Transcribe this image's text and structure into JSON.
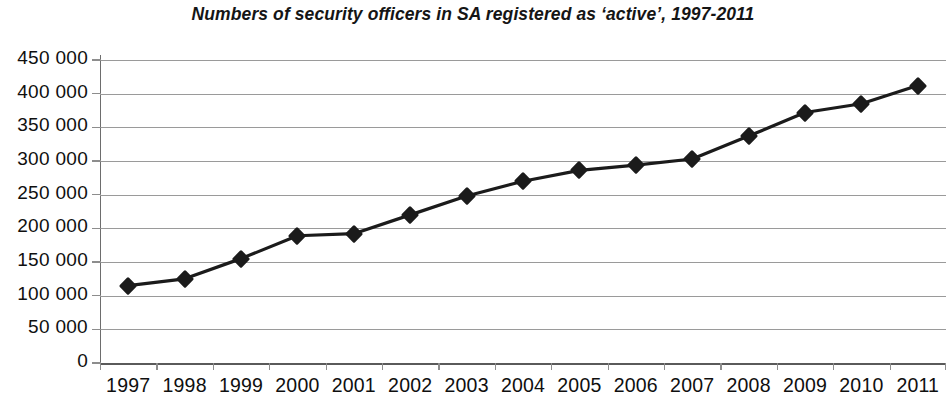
{
  "chart_data": {
    "type": "line",
    "title": "Numbers of security officers in SA registered as ‘active’, 1997-2011",
    "xlabel": "",
    "ylabel": "",
    "categories": [
      "1997",
      "1998",
      "1999",
      "2000",
      "2001",
      "2002",
      "2003",
      "2004",
      "2005",
      "2006",
      "2007",
      "2008",
      "2009",
      "2010",
      "2011"
    ],
    "values": [
      115000,
      125000,
      155000,
      189000,
      192000,
      220000,
      248000,
      270000,
      286000,
      294000,
      303000,
      337000,
      372000,
      385000,
      412000
    ],
    "series": [
      {
        "name": "Active registered security officers",
        "values": [
          115000,
          125000,
          155000,
          189000,
          192000,
          220000,
          248000,
          270000,
          286000,
          294000,
          303000,
          337000,
          372000,
          385000,
          412000
        ]
      }
    ],
    "ylim": [
      0,
      450000
    ],
    "ytick_values": [
      0,
      50000,
      100000,
      150000,
      200000,
      250000,
      300000,
      350000,
      400000,
      450000
    ],
    "ytick_labels": [
      "0",
      "50 000",
      "100 000",
      "150 000",
      "200 000",
      "250 000",
      "300 000",
      "350 000",
      "400 000",
      "450 000"
    ],
    "grid": true,
    "grid_axis": "y",
    "legend": false,
    "legend_position": "none",
    "marker": "diamond",
    "line_color": "#1b1b1b",
    "marker_color": "#1b1b1b",
    "grid_color": "#9a9a9a",
    "background_color": "#ffffff",
    "text_color": "#101010"
  }
}
